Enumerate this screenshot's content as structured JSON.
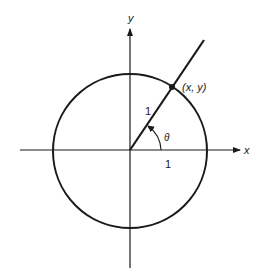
{
  "diagram": {
    "type": "unit-circle",
    "colors": {
      "background": "#ffffff",
      "stroke": "#1a1a1a"
    },
    "axes": {
      "x_label": "x",
      "y_label": "y"
    },
    "circle": {
      "radius_label": "1",
      "x_intercept_label": "1"
    },
    "point": {
      "label": "(x, y)"
    },
    "angle": {
      "label": "θ"
    }
  }
}
